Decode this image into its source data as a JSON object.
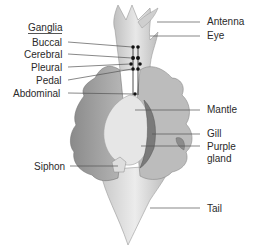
{
  "diagram": {
    "left_labels": {
      "group_title": "Ganglia",
      "items": [
        "Buccal",
        "Cerebral",
        "Pleural",
        "Pedal",
        "Abdominal"
      ],
      "siphon": "Siphon"
    },
    "right_labels": {
      "antenna": "Antenna",
      "eye": "Eye",
      "mantle": "Mantle",
      "gill": "Gill",
      "purple_gland_line1": "Purple",
      "purple_gland_line2": "gland",
      "tail": "Tail"
    },
    "colors": {
      "body_light": "#d9d9d9",
      "body_mid": "#b3b3b3",
      "body_dark": "#8c8c8c",
      "mantle": "#e6e6e6",
      "gill": "#7a7a7a",
      "leader_line": "#555555",
      "ganglia": "#111111"
    }
  }
}
